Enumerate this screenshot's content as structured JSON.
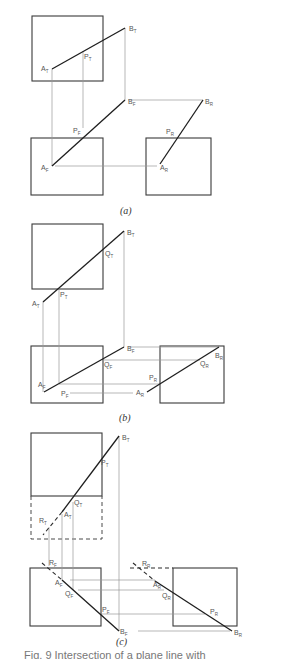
{
  "figure": {
    "panels": [
      {
        "id": "a",
        "caption": "(a)",
        "labels": {
          "A_T": "A",
          "A_T_sub": "T",
          "B_T": "B",
          "B_T_sub": "T",
          "P_T": "P",
          "P_T_sub": "T",
          "B_F": "B",
          "B_F_sub": "F",
          "B_R": "B",
          "B_R_sub": "R",
          "P_F": "P",
          "P_F_sub": "F",
          "P_R": "P",
          "P_R_sub": "R",
          "A_F": "A",
          "A_F_sub": "F",
          "A_R": "A",
          "A_R_sub": "R"
        }
      },
      {
        "id": "b",
        "caption": "(b)",
        "labels": {
          "B_T": "B",
          "B_T_sub": "T",
          "Q_T": "Q",
          "Q_T_sub": "T",
          "A_T": "A",
          "A_T_sub": "T",
          "P_T": "P",
          "P_T_sub": "T",
          "B_F": "B",
          "B_F_sub": "F",
          "Q_F": "Q",
          "Q_F_sub": "F",
          "A_F": "A",
          "A_F_sub": "F",
          "P_F": "P",
          "P_F_sub": "F",
          "A_R": "A",
          "A_R_sub": "R",
          "P_R": "P",
          "P_R_sub": "R",
          "B_R": "B",
          "B_R_sub": "R",
          "Q_R": "Q",
          "Q_R_sub": "R"
        }
      },
      {
        "id": "c",
        "caption": "(c)",
        "labels": {
          "B_T": "B",
          "B_T_sub": "T",
          "P_T": "P",
          "P_T_sub": "T",
          "Q_T": "Q",
          "Q_T_sub": "T",
          "A_T": "A",
          "A_T_sub": "T",
          "R_T": "R",
          "R_T_sub": "T",
          "R_F": "R",
          "R_F_sub": "F",
          "A_F": "A",
          "A_F_sub": "F",
          "Q_F": "Q",
          "Q_F_sub": "F",
          "P_F": "P",
          "P_F_sub": "F",
          "B_F": "B",
          "B_F_sub": "F",
          "R_R": "R",
          "R_R_sub": "R",
          "A_R": "A",
          "A_R_sub": "R",
          "Q_R": "Q",
          "Q_R_sub": "R",
          "P_R": "P",
          "P_R_sub": "R",
          "B_R": "B",
          "B_R_sub": "R"
        }
      }
    ],
    "bottom_caption_partial": "Fig. 9  Intersection of a plane line with"
  }
}
